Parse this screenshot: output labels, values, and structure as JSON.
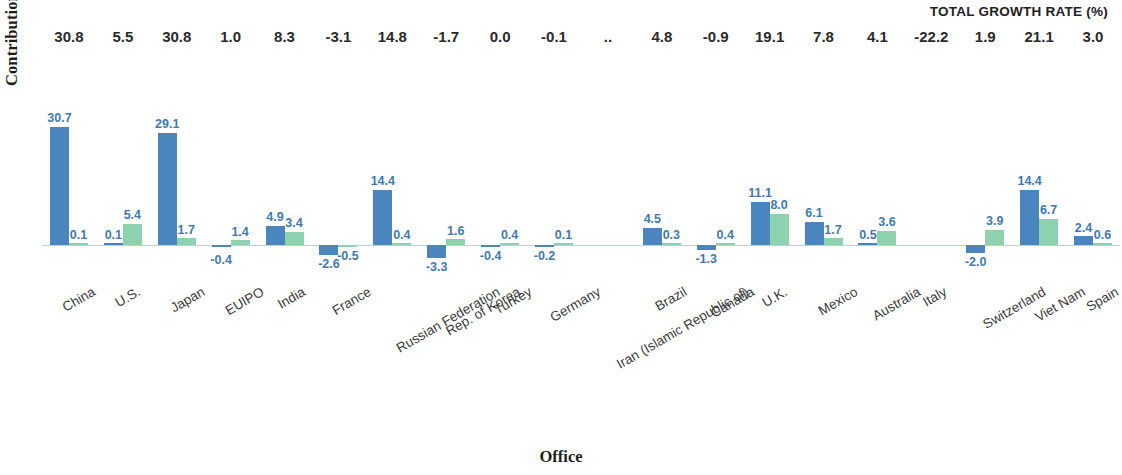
{
  "axes": {
    "ylabel": "Contribution to growth",
    "xlabel": "Office"
  },
  "header": {
    "caption": "TOTAL GROWTH RATE (%)"
  },
  "colors": {
    "blue": "#4a85bd",
    "green": "#8ed1ae",
    "label_blue": "#3f79b0",
    "baseline": "#b9cfe0"
  },
  "chart_data": {
    "type": "bar",
    "title": "",
    "subtitle": "",
    "xlabel": "Office",
    "ylabel": "Contribution to growth",
    "grid": false,
    "legend_position": "none",
    "ylim": [
      -4,
      32
    ],
    "annotation_row_label": "TOTAL GROWTH RATE (%)",
    "categories": [
      "China",
      "U.S.",
      "Japan",
      "EUIPO",
      "India",
      "France",
      "Russian Federation",
      "Rep. of Korea",
      "Turkey",
      "Germany",
      "Iran (Islamic Republic of)",
      "Brazil",
      "Canada",
      "U.K.",
      "Mexico",
      "Australia",
      "Italy",
      "Switzerland",
      "Viet Nam",
      "Spain"
    ],
    "total_growth_rate": [
      "30.8",
      "5.5",
      "30.8",
      "1.0",
      "8.3",
      "-3.1",
      "14.8",
      "-1.7",
      "0.0",
      "-0.1",
      "..",
      "4.8",
      "-0.9",
      "19.1",
      "7.8",
      "4.1",
      "-22.2",
      "1.9",
      "21.1",
      "3.0"
    ],
    "series": [
      {
        "name": "Resident",
        "color": "#4a85bd",
        "values": [
          30.7,
          0.1,
          29.1,
          null,
          4.9,
          -2.6,
          14.4,
          -3.3,
          -0.4,
          -0.2,
          null,
          4.5,
          -1.3,
          11.1,
          6.1,
          0.5,
          null,
          -2.0,
          14.4,
          2.4
        ],
        "labels": [
          "30.7",
          "0.1",
          "29.1",
          "",
          "4.9",
          "-2.6",
          "14.4",
          "-3.3",
          "-0.4",
          "-0.2",
          "",
          "4.5",
          "-1.3",
          "11.1",
          "6.1",
          "0.5",
          "",
          "-2.0",
          "14.4",
          "2.4"
        ]
      },
      {
        "name": "Non-resident",
        "color": "#8ed1ae",
        "values": [
          0.1,
          5.4,
          1.7,
          1.4,
          3.4,
          -0.5,
          0.4,
          1.6,
          0.4,
          0.1,
          null,
          0.3,
          0.4,
          8.0,
          1.7,
          3.6,
          null,
          3.9,
          6.7,
          0.6
        ],
        "labels": [
          "0.1",
          "5.4",
          "1.7",
          "1.4",
          "3.4",
          "-0.5",
          "0.4",
          "1.6",
          "0.4",
          "0.1",
          "",
          "0.3",
          "0.4",
          "8.0",
          "1.7",
          "3.6",
          "",
          "3.9",
          "6.7",
          "0.6"
        ]
      }
    ],
    "extra_negative_labels": {
      "EUIPO": "-0.4"
    }
  }
}
